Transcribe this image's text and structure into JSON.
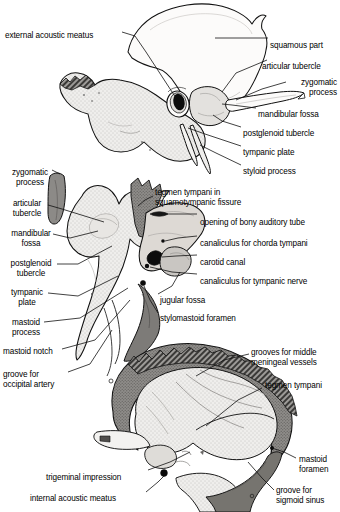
{
  "figure": {
    "background_color": "#ffffff",
    "ink_color": "#000000",
    "fill_light": "#f0efed",
    "fill_mid": "#c9c7c3",
    "fill_dark": "#8d8b88",
    "fill_black": "#111111"
  },
  "panels": [
    {
      "name": "lateral-view",
      "labels_left": [
        {
          "id": "external-acoustic-meatus",
          "text": "external acoustic meatus",
          "x": 5,
          "y": 31,
          "align": "left"
        }
      ],
      "labels_right": [
        {
          "id": "squamous-part",
          "text": "squamous part",
          "x": 270,
          "y": 41,
          "align": "left"
        },
        {
          "id": "articular-tubercle",
          "text": "articular tubercle",
          "x": 262,
          "y": 62,
          "align": "left"
        },
        {
          "id": "zygomatic-process",
          "text": "zygomatic\nprocess",
          "x": 287,
          "y": 78,
          "align": "left"
        },
        {
          "id": "mandibular-fossa",
          "text": "mandibular fossa",
          "x": 258,
          "y": 110,
          "align": "left"
        },
        {
          "id": "postglenoid-tubercle",
          "text": "postglenoid tubercle",
          "x": 243,
          "y": 129,
          "align": "left"
        },
        {
          "id": "tympanic-plate",
          "text": "tympanic plate",
          "x": 243,
          "y": 148,
          "align": "left"
        },
        {
          "id": "styloid-process",
          "text": "styloid process",
          "x": 243,
          "y": 167,
          "align": "left"
        }
      ]
    },
    {
      "name": "inferior-view",
      "labels_left": [
        {
          "id": "zygomatic-process-2",
          "text": "zygomatic\nprocess",
          "x": 3,
          "y": 168,
          "align": "left"
        },
        {
          "id": "articular-tubercle-2",
          "text": "articular\ntubercle",
          "x": 3,
          "y": 199,
          "align": "left"
        },
        {
          "id": "mandibular-fossa-2",
          "text": "mandibular\nfossa",
          "x": 3,
          "y": 229,
          "align": "left"
        },
        {
          "id": "postglenoid-tubercle-2",
          "text": "postglenoid\ntubercle",
          "x": 3,
          "y": 259,
          "align": "left"
        },
        {
          "id": "tympanic-plate-2",
          "text": "tympanic\nplate",
          "x": 3,
          "y": 288,
          "align": "left"
        },
        {
          "id": "mastoid-process",
          "text": "mastoid\nprocess",
          "x": 3,
          "y": 318,
          "align": "left"
        },
        {
          "id": "mastoid-notch",
          "text": "mastoid notch",
          "x": 3,
          "y": 347,
          "align": "left"
        },
        {
          "id": "groove-for-occipital-artery",
          "text": "groove for\noccipital artery",
          "x": 3,
          "y": 370,
          "align": "left"
        }
      ],
      "labels_right": [
        {
          "id": "tegmen-tympani-squamotympanic",
          "text": "tegmen tympani in\nsquamotympanic fissure",
          "x": 155,
          "y": 188,
          "align": "left"
        },
        {
          "id": "opening-of-bony-auditory-tube",
          "text": "opening of bony auditory tube",
          "x": 200,
          "y": 218,
          "align": "left"
        },
        {
          "id": "canaliculus-for-chorda-tympani",
          "text": "canaliculus for chorda tympani",
          "x": 200,
          "y": 239,
          "align": "left"
        },
        {
          "id": "carotid-canal",
          "text": "carotid canal",
          "x": 200,
          "y": 258,
          "align": "left"
        },
        {
          "id": "canaliculus-for-tympanic-nerve",
          "text": "canaliculus for tympanic nerve",
          "x": 200,
          "y": 277,
          "align": "left"
        },
        {
          "id": "jugular-fossa",
          "text": "jugular fossa",
          "x": 160,
          "y": 296,
          "align": "left"
        },
        {
          "id": "stylomastoid-foramen",
          "text": "stylomastoid foramen",
          "x": 160,
          "y": 314,
          "align": "left"
        }
      ]
    },
    {
      "name": "internal-view",
      "labels_left": [
        {
          "id": "trigeminal-impression",
          "text": "trigeminal impression",
          "x": 46,
          "y": 473,
          "align": "left"
        },
        {
          "id": "internal-acoustic-meatus",
          "text": "internal acoustic meatus",
          "x": 30,
          "y": 494,
          "align": "left"
        }
      ],
      "labels_right": [
        {
          "id": "grooves-for-middle-meningeal-vessels",
          "text": "grooves for middle\nmeningeal vessels",
          "x": 251,
          "y": 348,
          "align": "left"
        },
        {
          "id": "tegmen-tympani",
          "text": "tegmen tympani",
          "x": 265,
          "y": 381,
          "align": "left"
        },
        {
          "id": "mastoid-foramen",
          "text": "mastoid\nforamen",
          "x": 299,
          "y": 455,
          "align": "left"
        },
        {
          "id": "groove-for-sigmoid-sinus",
          "text": "groove for\nsigmoid sinus",
          "x": 276,
          "y": 486,
          "align": "left"
        }
      ]
    }
  ]
}
